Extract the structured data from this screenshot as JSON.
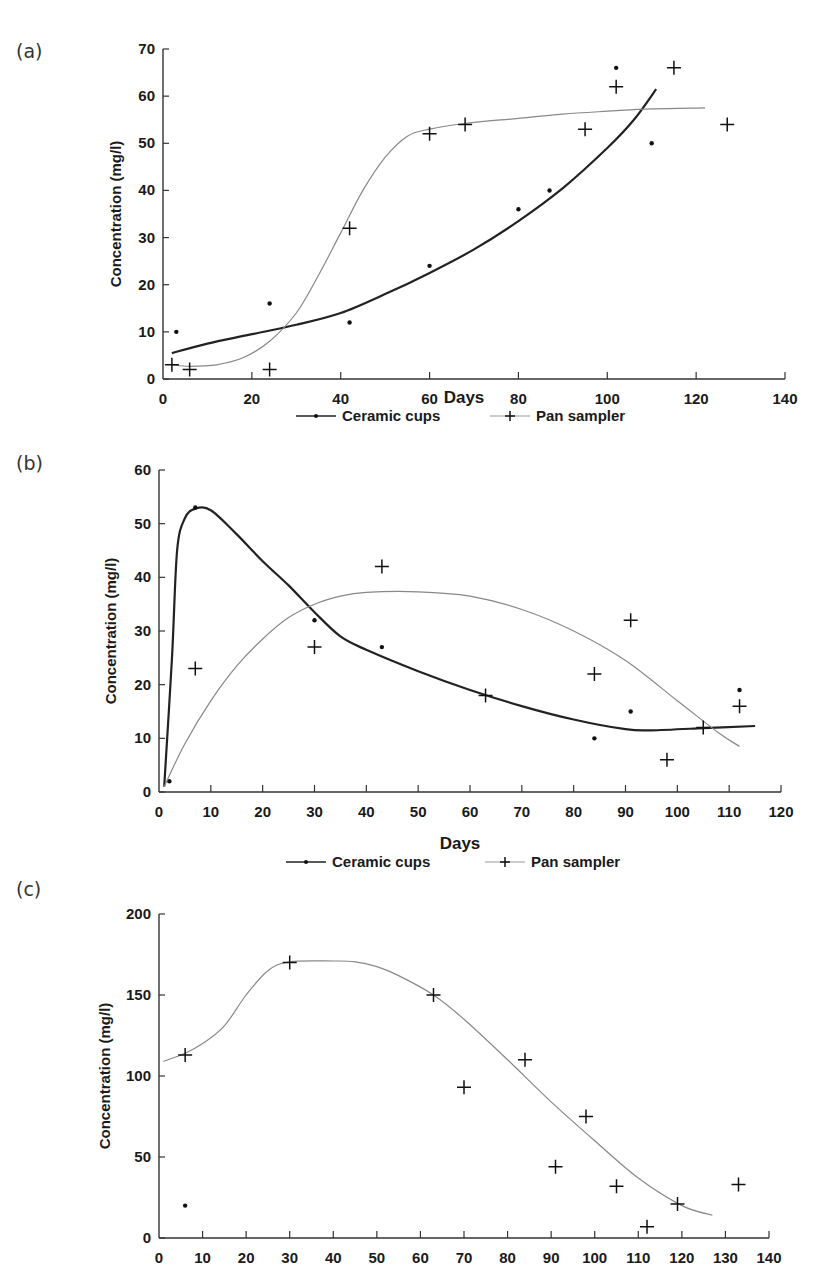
{
  "chart_data": [
    {
      "id": "a",
      "panel_label": "(a)",
      "type": "scatter",
      "title": "",
      "xlabel": "Days",
      "ylabel": "Concentration (mg/l)",
      "xlim": [
        0,
        140
      ],
      "ylim": [
        0,
        70
      ],
      "xticks": [
        0,
        20,
        40,
        60,
        80,
        100,
        120,
        140
      ],
      "yticks": [
        0,
        10,
        20,
        30,
        40,
        50,
        60,
        70
      ],
      "grid": false,
      "legend_position": "bottom",
      "legend": [
        {
          "name": "Ceramic cups",
          "marker": "dot",
          "line": "thick dark"
        },
        {
          "name": "Pan sampler",
          "marker": "plus",
          "line": "thin grey"
        }
      ],
      "series": [
        {
          "name": "Ceramic cups",
          "marker": "dot",
          "points": [
            [
              3,
              10
            ],
            [
              24,
              16
            ],
            [
              42,
              12
            ],
            [
              60,
              24
            ],
            [
              80,
              36
            ],
            [
              87,
              40
            ],
            [
              102,
              66
            ],
            [
              110,
              50
            ]
          ],
          "fit": [
            [
              2,
              5.5
            ],
            [
              10,
              7.5
            ],
            [
              20,
              9.5
            ],
            [
              30,
              11.5
            ],
            [
              40,
              14
            ],
            [
              50,
              18
            ],
            [
              60,
              22.5
            ],
            [
              70,
              27.5
            ],
            [
              80,
              33.5
            ],
            [
              90,
              40.5
            ],
            [
              100,
              49
            ],
            [
              106,
              55
            ],
            [
              111,
              61.5
            ]
          ]
        },
        {
          "name": "Pan sampler",
          "marker": "plus",
          "points": [
            [
              2,
              3
            ],
            [
              6,
              2
            ],
            [
              24,
              2
            ],
            [
              42,
              32
            ],
            [
              60,
              52
            ],
            [
              68,
              54
            ],
            [
              95,
              53
            ],
            [
              102,
              62
            ],
            [
              115,
              66
            ],
            [
              127,
              54
            ]
          ],
          "fit": [
            [
              2,
              3
            ],
            [
              6,
              2.7
            ],
            [
              12,
              3
            ],
            [
              18,
              4.5
            ],
            [
              24,
              8
            ],
            [
              30,
              14
            ],
            [
              35,
              22
            ],
            [
              40,
              31
            ],
            [
              45,
              40
            ],
            [
              50,
              47
            ],
            [
              55,
              51.5
            ],
            [
              60,
              53
            ],
            [
              68,
              54.2
            ],
            [
              80,
              55.3
            ],
            [
              90,
              56.2
            ],
            [
              100,
              56.8
            ],
            [
              110,
              57.3
            ],
            [
              122,
              57.5
            ]
          ]
        }
      ]
    },
    {
      "id": "b",
      "panel_label": "(b)",
      "type": "scatter",
      "title": "",
      "xlabel": "Days",
      "ylabel": "Concentration (mg/l)",
      "xlim": [
        0,
        120
      ],
      "ylim": [
        0,
        60
      ],
      "xticks": [
        0,
        10,
        20,
        30,
        40,
        50,
        60,
        70,
        80,
        90,
        100,
        110,
        120
      ],
      "yticks": [
        0,
        10,
        20,
        30,
        40,
        50,
        60
      ],
      "grid": false,
      "legend_position": "bottom",
      "legend": [
        {
          "name": "Ceramic cups",
          "marker": "dot",
          "line": "thick dark"
        },
        {
          "name": "Pan sampler",
          "marker": "plus",
          "line": "thin grey"
        }
      ],
      "series": [
        {
          "name": "Ceramic cups",
          "marker": "dot",
          "points": [
            [
              2,
              2
            ],
            [
              7,
              53
            ],
            [
              30,
              32
            ],
            [
              43,
              27
            ],
            [
              84,
              10
            ],
            [
              91,
              15
            ],
            [
              112,
              19
            ]
          ],
          "fit": [
            [
              1,
              1
            ],
            [
              2.5,
              25
            ],
            [
              3.5,
              45
            ],
            [
              5,
              51
            ],
            [
              7,
              52.8
            ],
            [
              10,
              52.5
            ],
            [
              15,
              48
            ],
            [
              20,
              43
            ],
            [
              25,
              38.5
            ],
            [
              30,
              33.5
            ],
            [
              35,
              29
            ],
            [
              40,
              26.5
            ],
            [
              50,
              22.5
            ],
            [
              60,
              19
            ],
            [
              70,
              16
            ],
            [
              80,
              13.5
            ],
            [
              90,
              11.7
            ],
            [
              95,
              11.5
            ],
            [
              105,
              11.9
            ],
            [
              115,
              12.3
            ]
          ]
        },
        {
          "name": "Pan sampler",
          "marker": "plus",
          "points": [
            [
              7,
              23
            ],
            [
              30,
              27
            ],
            [
              43,
              42
            ],
            [
              63,
              18
            ],
            [
              84,
              22
            ],
            [
              91,
              32
            ],
            [
              98,
              6
            ],
            [
              105,
              12
            ],
            [
              112,
              16
            ]
          ],
          "fit": [
            [
              1,
              1
            ],
            [
              5,
              9
            ],
            [
              10,
              17
            ],
            [
              15,
              23.5
            ],
            [
              20,
              28.5
            ],
            [
              25,
              32.5
            ],
            [
              30,
              35
            ],
            [
              35,
              36.5
            ],
            [
              40,
              37.2
            ],
            [
              50,
              37.3
            ],
            [
              60,
              36.5
            ],
            [
              70,
              34
            ],
            [
              80,
              30
            ],
            [
              90,
              24.5
            ],
            [
              100,
              17
            ],
            [
              108,
              11
            ],
            [
              112,
              8.5
            ]
          ]
        }
      ]
    },
    {
      "id": "c",
      "panel_label": "(c)",
      "type": "scatter",
      "title": "",
      "xlabel": "",
      "ylabel": "Concentration (mg/l)",
      "xlim": [
        0,
        140
      ],
      "ylim": [
        0,
        200
      ],
      "xticks": [
        0,
        10,
        20,
        30,
        40,
        50,
        60,
        70,
        80,
        90,
        100,
        110,
        120,
        130,
        140
      ],
      "yticks": [
        0,
        50,
        100,
        150,
        200
      ],
      "grid": false,
      "legend_position": "none",
      "legend": [],
      "series": [
        {
          "name": "Ceramic cups",
          "marker": "dot",
          "points": [
            [
              6,
              20
            ]
          ],
          "fit": []
        },
        {
          "name": "Pan sampler",
          "marker": "plus",
          "points": [
            [
              6,
              113
            ],
            [
              30,
              170
            ],
            [
              63,
              150
            ],
            [
              70,
              93
            ],
            [
              84,
              110
            ],
            [
              91,
              44
            ],
            [
              98,
              75
            ],
            [
              105,
              32
            ],
            [
              112,
              7
            ],
            [
              119,
              21
            ],
            [
              133,
              33
            ]
          ],
          "fit": [
            [
              1,
              109
            ],
            [
              6,
              114
            ],
            [
              10,
              120
            ],
            [
              15,
              131
            ],
            [
              20,
              150
            ],
            [
              25,
              165
            ],
            [
              30,
              170.5
            ],
            [
              40,
              171
            ],
            [
              45,
              170.5
            ],
            [
              50,
              167.5
            ],
            [
              55,
              162
            ],
            [
              63,
              150
            ],
            [
              70,
              135
            ],
            [
              80,
              110
            ],
            [
              90,
              84
            ],
            [
              100,
              60
            ],
            [
              110,
              37
            ],
            [
              120,
              20
            ],
            [
              127,
              14
            ]
          ]
        }
      ]
    }
  ],
  "figure": {
    "panels": [
      {
        "label": "(a)",
        "xlabel": "Days",
        "ylabel": "Concentration (mg/l)",
        "legend": [
          "Ceramic cups",
          "Pan sampler"
        ]
      },
      {
        "label": "(b)",
        "xlabel": "Days",
        "ylabel": "Concentration (mg/l)",
        "legend": [
          "Ceramic cups",
          "Pan sampler"
        ]
      },
      {
        "label": "(c)",
        "xlabel": "",
        "ylabel": "Concentration (mg/l)",
        "legend": []
      }
    ]
  }
}
